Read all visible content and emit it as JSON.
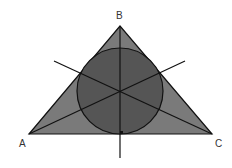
{
  "diagram": {
    "labels": {
      "A": "A",
      "B": "B",
      "C": "C"
    },
    "vertices": {
      "A": [
        29,
        134
      ],
      "B": [
        120,
        26
      ],
      "C": [
        212,
        134
      ]
    },
    "incircle": {
      "cx": 120,
      "cy": 92,
      "r": 43
    },
    "colors": {
      "triangle_fill": "#7a7a7a",
      "circle_fill": "#555555",
      "stroke": "#111111"
    }
  }
}
